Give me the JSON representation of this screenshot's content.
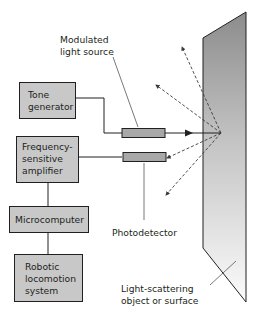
{
  "diagram": {
    "blocks": {
      "tone_generator": [
        "Tone",
        "generator"
      ],
      "frequency_amplifier": [
        "Frequency-",
        "sensitive",
        "amplifier"
      ],
      "microcomputer": [
        "Microcomputer"
      ],
      "robotic_locomotion": [
        "Robotic",
        "locomotion",
        "system"
      ]
    },
    "callouts": {
      "light_source": [
        "Modulated",
        "light source"
      ],
      "photodetector": [
        "Photodetector"
      ],
      "surface": [
        "Light-scattering",
        "object or surface"
      ]
    },
    "colors": {
      "block_fill": "#c8c8c8",
      "block_stroke": "#231f20",
      "component_fill": "#a8a8a8",
      "surface_dark": "#8a8a8a",
      "surface_light": "#f2f2f2",
      "line": "#231f20",
      "dashed": "#3a3a3a"
    }
  }
}
